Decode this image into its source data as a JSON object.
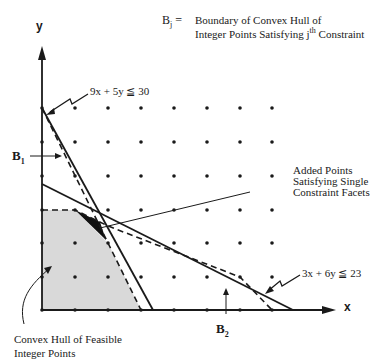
{
  "legend": {
    "symbol": "B",
    "symbol_sub": "j",
    "equals": "=",
    "line1": "Boundary of Convex Hull of",
    "line2_a": "Integer Points Satisfying j",
    "line2_sup": "th",
    "line2_b": " Constraint"
  },
  "axes": {
    "x_label": "x",
    "y_label": "y"
  },
  "constraints": [
    {
      "id": "c1",
      "text": "9x + 5y ≦ 30"
    },
    {
      "id": "c2",
      "text": "3x + 6y ≦ 23"
    }
  ],
  "boundaries": [
    {
      "symbol": "B",
      "sub": "1"
    },
    {
      "symbol": "B",
      "sub": "2"
    }
  ],
  "annotations": {
    "added_points_1": "Added Points",
    "added_points_2": "Satisfying Single",
    "added_points_3": "Constraint Facets",
    "hull_1": "Convex Hull of Feasible",
    "hull_2": "Integer Points"
  },
  "colors": {
    "hull_fill": "#d9d9d9",
    "ink": "#1a1a1a",
    "added_region": "#111111"
  }
}
